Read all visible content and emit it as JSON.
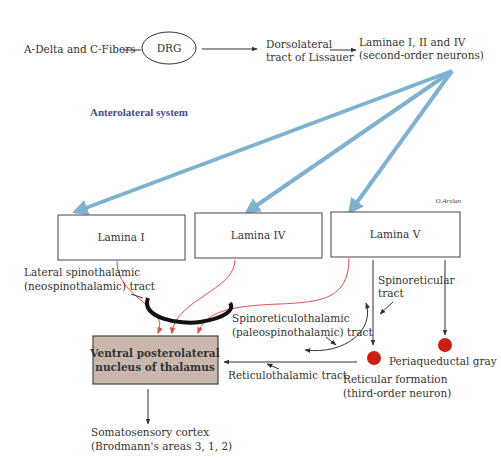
{
  "diagram": {
    "title": "Anterolateral system",
    "signature": "O.Arslan",
    "nodes": {
      "fibers": "A-Delta and C-Fibers",
      "drg": "DRG",
      "lissauer": [
        "Dorsolateral",
        "tract of Lissauer"
      ],
      "laminae": [
        "Laminae I, II and IV",
        "(second-order neurons)"
      ],
      "lamina_1": "Lamina I",
      "lamina_4": "Lamina IV",
      "lamina_5": "Lamina V",
      "vpl": [
        "Ventral posterolateral",
        "nucleus of thalamus"
      ],
      "cortex": [
        "Somatosensory cortex",
        "(Brodmann's areas 3, 1, 2)"
      ],
      "reticular": [
        "Reticular formation",
        "(third-order neuron)"
      ],
      "pag": "Periaqueductal gray"
    },
    "tracts": {
      "lateral_spinothalamic": [
        "Lateral spinothalamic",
        "(neospinothalamic) tract"
      ],
      "spinoreticulothalamic": [
        "Spinoreticulothalamic",
        "(paleospinothalamic) tract"
      ],
      "spinoreticular": [
        "Spinoreticular",
        "tract"
      ],
      "reticulothalamic": "Reticulothalamic tract"
    },
    "colors": {
      "blue_arrows": "#7fb2d0",
      "red_fibers": "#e0504a",
      "vpl_fill": "#c9b7ae",
      "nucleus_dots": "#cc1f14",
      "title": "#4a4a8c"
    }
  }
}
